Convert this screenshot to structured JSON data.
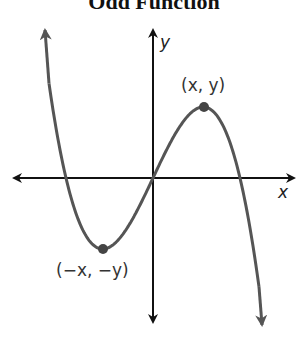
{
  "chart_data": {
    "type": "line",
    "title": "Odd Function",
    "xlabel": "x",
    "ylabel": "y",
    "grid": false,
    "ticks": false,
    "series": [
      {
        "name": "odd cubic f(x) = k·x(r² − x²)",
        "shape": "cubic",
        "description": "Rises from upper left, crosses x-axis, reaches local min at (-x,-y), passes through origin, local max at (x,y), falls to lower right",
        "color": "#555555",
        "key_points_px": {
          "origin": [
            153,
            178
          ],
          "local_max": [
            204,
            107
          ],
          "local_min": [
            103,
            249
          ],
          "x_intercepts": [
            66,
            153,
            240
          ],
          "left_end_arrow": [
            45,
            30
          ],
          "right_end_arrow": [
            262,
            325
          ]
        }
      }
    ],
    "annotations": [
      {
        "text": "(x, y)",
        "point": "local_max"
      },
      {
        "text": "(−x, −y)",
        "point": "local_min"
      }
    ],
    "axes": {
      "origin_px": [
        153,
        178
      ],
      "x_axis": {
        "from": 14,
        "to": 294,
        "both_arrows": true
      },
      "y_axis": {
        "from": 30,
        "to": 322,
        "both_arrows": true
      }
    }
  },
  "labels": {
    "title": "Odd Function",
    "x_axis": "x",
    "y_axis": "y",
    "point_max": "(x, y)",
    "point_min": "(−x, −y)"
  },
  "colors": {
    "axis": "#111111",
    "curve": "#555555",
    "dot": "#444444"
  }
}
